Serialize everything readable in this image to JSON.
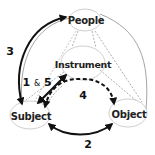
{
  "nodes": {
    "people": {
      "label": "People",
      "cx": 85,
      "cy": 20,
      "rx": 16,
      "ry": 11
    },
    "instrument": {
      "label": "Instrument",
      "cx": 83,
      "cy": 63,
      "rx": 22,
      "ry": 17
    },
    "subject": {
      "label": "Subject",
      "cx": 30,
      "cy": 115,
      "rx": 20,
      "ry": 14
    },
    "object": {
      "label": "Object",
      "cx": 128,
      "cy": 113,
      "rx": 19,
      "ry": 14
    }
  },
  "edges": {
    "e3": {
      "label": "3",
      "from": "subject",
      "to": "people",
      "style": "solid-bold",
      "direction": "both"
    },
    "e1_5": {
      "label_a": "1",
      "label_amp": "&",
      "label_b": "5",
      "from": "subject",
      "to": "instrument",
      "style": "solid-bold",
      "direction": "both"
    },
    "e4": {
      "label": "4",
      "from": "instrument",
      "to": "subject-object",
      "style": "dashed-bold",
      "direction": "both"
    },
    "e2": {
      "label": "2",
      "from": "subject",
      "to": "object",
      "style": "solid-bold",
      "direction": "both"
    }
  },
  "colors": {
    "bold_arrow": "#111111",
    "thin_line": "#9a9a9a",
    "node_stroke": "#c8c8c8",
    "text": "#222222"
  }
}
